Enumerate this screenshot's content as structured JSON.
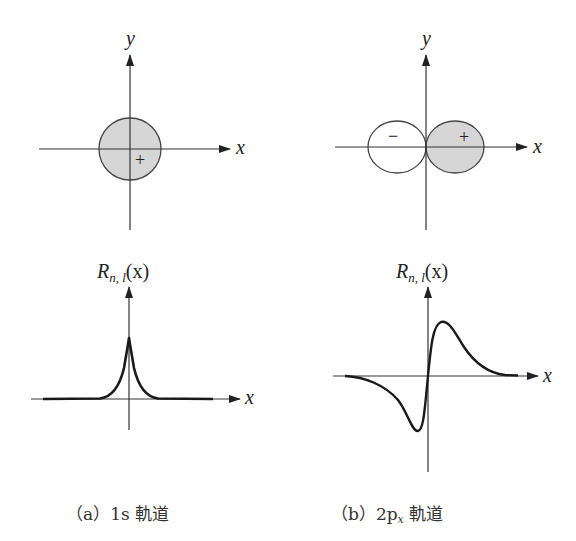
{
  "panels": [
    {
      "id": "a",
      "caption": "（a）1s 軌道",
      "caption_parts": {
        "prefix": "（a）1s",
        "suffix": " 軌道"
      },
      "orbital_diagram": {
        "x_label": "x",
        "y_label": "y",
        "shape": "circle",
        "lobes": [
          {
            "sign": "+",
            "shaded": true
          }
        ]
      },
      "radial_plot": {
        "y_label_main": "R",
        "y_label_sub": "n, l",
        "y_label_arg": "(x)",
        "x_label": "x",
        "curve": "cusp peak at origin, exponential decay both sides"
      }
    },
    {
      "id": "b",
      "caption": "（b）2pₓ 軌道",
      "caption_parts": {
        "prefix": "（b）2p",
        "sub": "x",
        "suffix": " 軌道"
      },
      "orbital_diagram": {
        "x_label": "x",
        "y_label": "y",
        "shape": "two lobes along x",
        "lobes": [
          {
            "sign": "−",
            "shaded": false
          },
          {
            "sign": "+",
            "shaded": true
          }
        ]
      },
      "radial_plot": {
        "y_label_main": "R",
        "y_label_sub": "n, l",
        "y_label_arg": "(x)",
        "x_label": "x",
        "curve": "odd function: minimum left of origin, maximum right of origin"
      }
    }
  ],
  "colors": {
    "line": "#222222",
    "shade": "#d6d6d6",
    "background": "#ffffff"
  }
}
